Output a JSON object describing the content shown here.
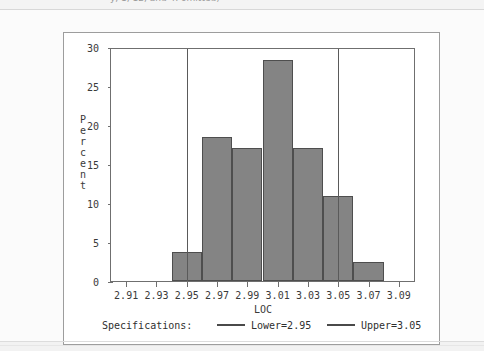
{
  "top_clipped_note": "y, 1, 12, and 4: omitted)",
  "chart_data": {
    "type": "bar",
    "title": "",
    "subtitle": "",
    "xlabel": "LOC",
    "ylabel": "Percent",
    "ylabel_chars": [
      "P",
      "e",
      "r",
      "c",
      "e",
      "n",
      "t"
    ],
    "grid": false,
    "xlim": [
      2.9,
      3.1
    ],
    "ylim": [
      0,
      30
    ],
    "ytick_labels": [
      "0",
      "5",
      "10",
      "15",
      "20",
      "25",
      "30"
    ],
    "ytick_values": [
      0,
      5,
      10,
      15,
      20,
      25,
      30
    ],
    "xtick_labels": [
      "2.91",
      "2.93",
      "2.95",
      "2.97",
      "2.99",
      "3.01",
      "3.03",
      "3.05",
      "3.07",
      "3.09"
    ],
    "xtick_values": [
      2.91,
      2.93,
      2.95,
      2.97,
      2.99,
      3.01,
      3.03,
      3.05,
      3.07,
      3.09
    ],
    "bin_edges": [
      2.94,
      2.96,
      2.98,
      3.0,
      3.02,
      3.04,
      3.06,
      3.08
    ],
    "categories": [
      "2.94-2.96",
      "2.96-2.98",
      "2.98-3.00",
      "3.00-3.02",
      "3.02-3.04",
      "3.04-3.06",
      "3.06-3.08"
    ],
    "values": [
      3.8,
      18.6,
      17.2,
      28.6,
      17.2,
      11.0,
      2.5
    ],
    "bar_color": "#848484",
    "bar_edge_color": "#4e4e4e",
    "reference_lines": [
      {
        "name": "Lower",
        "value": 2.95,
        "color": "#5a5a5a"
      },
      {
        "name": "Upper",
        "value": 3.05,
        "color": "#5a5a5a"
      }
    ],
    "legend": {
      "position": "below-axis",
      "title": "Specifications:",
      "entries": [
        {
          "label": "Lower=2.95",
          "color": "#4a4a4a"
        },
        {
          "label": "Upper=3.05",
          "color": "#4a4a4a"
        }
      ]
    }
  }
}
